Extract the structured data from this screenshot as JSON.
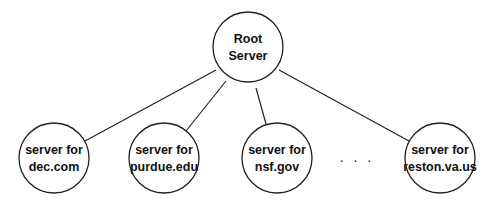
{
  "diagram": {
    "type": "tree",
    "root": {
      "id": "root",
      "lines": [
        "Root",
        "Server"
      ],
      "cx": 248,
      "cy": 47,
      "r": 35
    },
    "children": [
      {
        "id": "dec",
        "lines": [
          "server for",
          "dec.com"
        ],
        "cx": 54,
        "cy": 158,
        "r": 35,
        "edge": [
          216,
          70,
          85,
          141
        ]
      },
      {
        "id": "purdue",
        "lines": [
          "server for",
          "purdue.edu"
        ],
        "cx": 164,
        "cy": 158,
        "r": 35,
        "edge": [
          226,
          81,
          186,
          131
        ]
      },
      {
        "id": "nsf",
        "lines": [
          "server for",
          "nsf.gov"
        ],
        "cx": 277,
        "cy": 158,
        "r": 35,
        "edge": [
          256,
          88,
          266,
          124
        ]
      },
      {
        "id": "reston",
        "lines": [
          "server for",
          "reston.va.us"
        ],
        "cx": 440,
        "cy": 158,
        "r": 35,
        "edge": [
          279,
          70,
          409,
          141
        ]
      }
    ],
    "ellipsis": {
      "text": ". . .",
      "x": 357,
      "y": 162
    }
  }
}
